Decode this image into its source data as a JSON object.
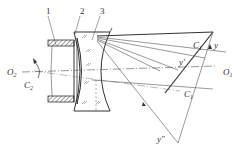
{
  "diagram": {
    "part_labels": [
      "1",
      "2",
      "3"
    ],
    "axis_labels": {
      "o2": {
        "main": "O",
        "sub": "2"
      },
      "o1": {
        "main": "O",
        "sub": "1"
      }
    },
    "rotation_labels": {
      "c2": {
        "main": "C",
        "sub": "2"
      },
      "c1_upper": {
        "main": "C",
        "sub": "1"
      },
      "c1_lower": {
        "main": "C",
        "sub": "1"
      }
    },
    "image_labels": {
      "y": "y",
      "y_prime": "y′",
      "y_double_prime": "y″"
    },
    "colors": {
      "line": "#333333",
      "thin_line": "#555555",
      "hatch": "#444444"
    }
  }
}
